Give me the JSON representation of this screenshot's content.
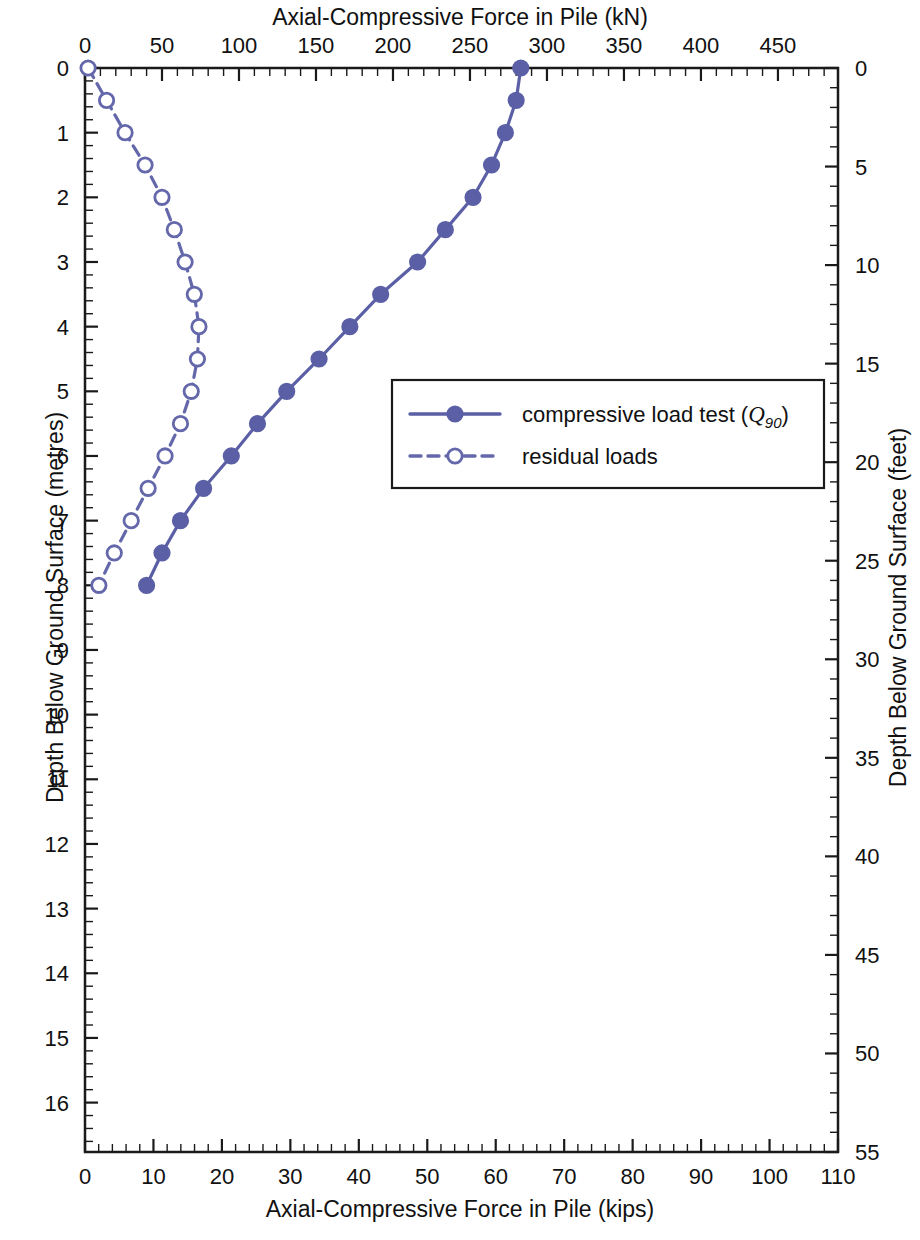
{
  "chart_data": {
    "type": "line",
    "title": "",
    "top_axis": {
      "label": "Axial-Compressive Force in Pile (kN)",
      "ticks": [
        0,
        50,
        100,
        150,
        200,
        250,
        300,
        350,
        400,
        450
      ],
      "range": [
        0,
        489
      ],
      "minor_tick_step": 10
    },
    "bottom_axis": {
      "label": "Axial-Compressive Force in Pile (kips)",
      "ticks": [
        0,
        10,
        20,
        30,
        40,
        50,
        60,
        70,
        80,
        90,
        100,
        110
      ],
      "range": [
        0,
        110
      ],
      "minor_tick_step": 2
    },
    "left_axis": {
      "label": "Depth Below Ground Surface (metres)",
      "ticks": [
        0,
        1,
        2,
        3,
        4,
        5,
        6,
        7,
        8,
        9,
        10,
        11,
        12,
        13,
        14,
        15,
        16
      ],
      "range": [
        0,
        16.764
      ],
      "minor_tick_step": 0.2,
      "inverted": true
    },
    "right_axis": {
      "label": "Depth Below Ground Surface (feet)",
      "ticks": [
        0,
        5,
        10,
        15,
        20,
        25,
        30,
        35,
        40,
        45,
        50,
        55
      ],
      "range": [
        0,
        55
      ],
      "minor_tick_step": 1,
      "inverted": true
    },
    "grid": false,
    "legend_position": "center-right",
    "series": [
      {
        "name": "compressive load test (Q90)",
        "label_main": "compressive load test (",
        "label_q": "Q",
        "label_sub": "90",
        "label_close": ")",
        "style": "solid",
        "marker": "filled-circle",
        "color": "#5b5fa5",
        "x_unit": "kN",
        "y_unit": "m",
        "points": [
          {
            "force_kN": 283,
            "force_kips": 63.6,
            "depth_m": 0.0
          },
          {
            "force_kN": 280,
            "force_kips": 62.9,
            "depth_m": 0.5
          },
          {
            "force_kN": 273,
            "force_kips": 61.4,
            "depth_m": 1.0
          },
          {
            "force_kN": 264,
            "force_kips": 59.3,
            "depth_m": 1.5
          },
          {
            "force_kN": 252,
            "force_kips": 56.6,
            "depth_m": 2.0
          },
          {
            "force_kN": 234,
            "force_kips": 52.6,
            "depth_m": 2.5
          },
          {
            "force_kN": 216,
            "force_kips": 48.6,
            "depth_m": 3.0
          },
          {
            "force_kN": 192,
            "force_kips": 43.2,
            "depth_m": 3.5
          },
          {
            "force_kN": 172,
            "force_kips": 38.7,
            "depth_m": 4.0
          },
          {
            "force_kN": 152,
            "force_kips": 34.2,
            "depth_m": 4.5
          },
          {
            "force_kN": 131,
            "force_kips": 29.5,
            "depth_m": 5.0
          },
          {
            "force_kN": 112,
            "force_kips": 25.2,
            "depth_m": 5.5
          },
          {
            "force_kN": 95,
            "force_kips": 21.4,
            "depth_m": 6.0
          },
          {
            "force_kN": 77,
            "force_kips": 17.3,
            "depth_m": 6.5
          },
          {
            "force_kN": 62,
            "force_kips": 13.9,
            "depth_m": 7.0
          },
          {
            "force_kN": 50,
            "force_kips": 11.2,
            "depth_m": 7.5
          },
          {
            "force_kN": 40,
            "force_kips": 9.0,
            "depth_m": 8.0
          }
        ]
      },
      {
        "name": "residual loads",
        "label_main": "residual loads",
        "style": "dashed",
        "marker": "open-circle",
        "color": "#6468ab",
        "x_unit": "kN",
        "y_unit": "m",
        "points": [
          {
            "force_kN": 2,
            "force_kips": 0.4,
            "depth_m": 0.0
          },
          {
            "force_kN": 14,
            "force_kips": 3.1,
            "depth_m": 0.5
          },
          {
            "force_kN": 26,
            "force_kips": 5.8,
            "depth_m": 1.0
          },
          {
            "force_kN": 39,
            "force_kips": 8.8,
            "depth_m": 1.5
          },
          {
            "force_kN": 50,
            "force_kips": 11.2,
            "depth_m": 2.0
          },
          {
            "force_kN": 58,
            "force_kips": 13.0,
            "depth_m": 2.5
          },
          {
            "force_kN": 65,
            "force_kips": 14.6,
            "depth_m": 3.0
          },
          {
            "force_kN": 71,
            "force_kips": 16.0,
            "depth_m": 3.5
          },
          {
            "force_kN": 74,
            "force_kips": 16.6,
            "depth_m": 4.0
          },
          {
            "force_kN": 73,
            "force_kips": 16.4,
            "depth_m": 4.5
          },
          {
            "force_kN": 69,
            "force_kips": 15.5,
            "depth_m": 5.0
          },
          {
            "force_kN": 62,
            "force_kips": 13.9,
            "depth_m": 5.5
          },
          {
            "force_kN": 52,
            "force_kips": 11.7,
            "depth_m": 6.0
          },
          {
            "force_kN": 41,
            "force_kips": 9.2,
            "depth_m": 6.5
          },
          {
            "force_kN": 30,
            "force_kips": 6.7,
            "depth_m": 7.0
          },
          {
            "force_kN": 19,
            "force_kips": 4.3,
            "depth_m": 7.5
          },
          {
            "force_kN": 9,
            "force_kips": 2.0,
            "depth_m": 8.0
          }
        ]
      }
    ]
  }
}
